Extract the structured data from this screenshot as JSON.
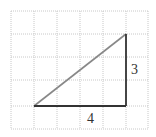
{
  "diagram": {
    "type": "right-triangle-on-grid",
    "grid": {
      "columns": 6,
      "rows": 5,
      "cell_size_px": 23,
      "line_color": "#c8c8c8",
      "line_style": "dotted"
    },
    "triangle": {
      "vertices_grid": [
        [
          1,
          4
        ],
        [
          5,
          4
        ],
        [
          5,
          1
        ]
      ],
      "hypotenuse_color": "#888888",
      "legs_color": "#333333"
    },
    "labels": {
      "vertical_leg": "3",
      "horizontal_leg": "4"
    }
  }
}
